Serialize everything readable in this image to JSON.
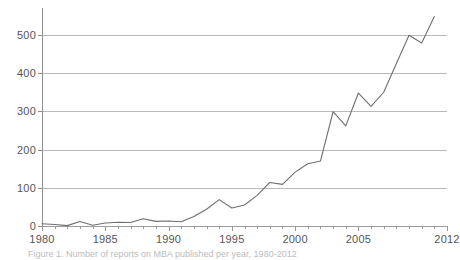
{
  "figure": {
    "caption": "Figure 1. Number of reports on MBA published per year, 1980-2012"
  },
  "chart_data": {
    "type": "line",
    "title": "",
    "subtitle": "",
    "xlabel": "",
    "ylabel": "",
    "xlim": [
      1980,
      2012
    ],
    "ylim": [
      0,
      560
    ],
    "grid": "horizontal",
    "legend": "none",
    "line_color": "#6e6e6e",
    "grid_color": "#b9b9b9",
    "axis_color": "#8f8f8f",
    "y_ticks": [
      0,
      100,
      200,
      300,
      400,
      500
    ],
    "y_tick_labels": [
      "0",
      "100",
      "200",
      "300",
      "400",
      "500"
    ],
    "x_ticks": [
      1980,
      1985,
      1990,
      1995,
      2000,
      2005,
      2012
    ],
    "x_tick_labels": [
      "1980",
      "1985",
      "1990",
      "1995",
      "2000",
      "2005",
      "2012"
    ],
    "x_minor_tick_interval": 1,
    "x": [
      1980,
      1981,
      1982,
      1983,
      1984,
      1985,
      1986,
      1987,
      1988,
      1989,
      1990,
      1991,
      1992,
      1993,
      1994,
      1995,
      1996,
      1997,
      1998,
      1999,
      2000,
      2001,
      2002,
      2003,
      2004,
      2005,
      2006,
      2007,
      2008,
      2009,
      2010,
      2011
    ],
    "values": [
      6,
      4,
      1,
      12,
      2,
      8,
      10,
      9,
      19,
      12,
      13,
      11,
      25,
      44,
      69,
      47,
      55,
      80,
      114,
      109,
      141,
      163,
      170,
      299,
      262,
      348,
      313,
      350,
      425,
      499,
      479,
      548
    ],
    "series": [
      {
        "name": "Publications per year",
        "values": [
          6,
          4,
          1,
          12,
          2,
          8,
          10,
          9,
          19,
          12,
          13,
          11,
          25,
          44,
          69,
          47,
          55,
          80,
          114,
          109,
          141,
          163,
          170,
          299,
          262,
          348,
          313,
          350,
          425,
          499,
          479,
          548
        ]
      }
    ]
  }
}
